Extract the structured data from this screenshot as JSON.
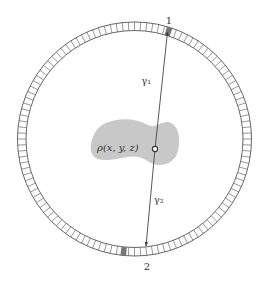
{
  "diagram": {
    "detector_ring": {
      "center": [
        134.5,
        139
      ],
      "outer_radius": 117,
      "inner_radius": 108.5,
      "segment_count": 120,
      "ring_color": "#555555",
      "segment_color": "#6a6a6a"
    },
    "detectors": [
      {
        "id": "1",
        "label": "1",
        "angle_deg": -72.5,
        "color": "#777777"
      },
      {
        "id": "2",
        "label": "2",
        "angle_deg": 95.5,
        "color": "#777777"
      }
    ],
    "source_distribution": {
      "label": "ρ(x, y, z)",
      "fill": "#c8c8c8"
    },
    "annihilation_point": [
      155,
      149
    ],
    "gamma_rays": [
      {
        "label": "γ₁",
        "display": "Y₁"
      },
      {
        "label": "γ₂",
        "display": "Y₂"
      }
    ],
    "line_color": "#444444"
  }
}
